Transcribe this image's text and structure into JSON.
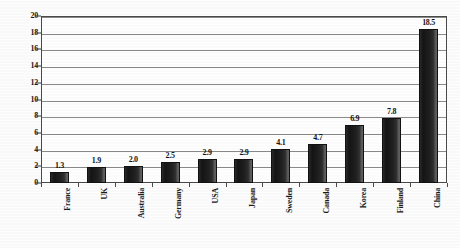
{
  "chart_data": {
    "type": "bar",
    "title": "",
    "xlabel": "",
    "ylabel": "",
    "ylim": [
      0,
      20
    ],
    "ytick_step": 2,
    "yticks": [
      0,
      2,
      4,
      6,
      8,
      10,
      12,
      14,
      16,
      18,
      20
    ],
    "grid": true,
    "legend": false,
    "orientation": "vertical",
    "bar_color": "#1c1c1c",
    "value_labels_shown": true,
    "categories": [
      "France",
      "UK",
      "Australia",
      "Germany",
      "USA",
      "Japan",
      "Sweden",
      "Canada",
      "Korea",
      "Finland",
      "China"
    ],
    "values": [
      1.3,
      1.9,
      2.0,
      2.5,
      2.9,
      2.9,
      4.1,
      4.7,
      6.9,
      7.8,
      18.5
    ],
    "value_labels": [
      "1.3",
      "1.9",
      "2.0",
      "2.5",
      "2.9",
      "2.9",
      "4.1",
      "4.7",
      "6.9",
      "7.8",
      "18.5"
    ]
  },
  "style": {
    "axis_color": "#4a4a4a",
    "gridline_color": "#8a8a8a",
    "text_color": "#1a1a1a",
    "background": "#ffffff"
  }
}
